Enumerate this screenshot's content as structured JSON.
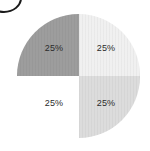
{
  "chart_data": {
    "type": "pie",
    "title": "",
    "subtitle": "",
    "xlabel": "",
    "ylabel": "",
    "legend_position": "none",
    "grid": false,
    "categories": [
      "Top left",
      "Top right",
      "Bottom right",
      "Bottom left"
    ],
    "values": [
      25,
      25,
      25,
      25
    ],
    "labels": [
      "25%",
      "25%",
      "25%",
      "25%"
    ],
    "slices": [
      {
        "name": "slice-top-left",
        "label": "25%",
        "value": 25,
        "start_angle": 270,
        "end_angle": 360,
        "color": "#9d9d9d",
        "filled": true
      },
      {
        "name": "slice-top-right",
        "label": "25%",
        "value": 25,
        "start_angle": 0,
        "end_angle": 90,
        "color": "#f0f0f0",
        "filled": true
      },
      {
        "name": "slice-bottom-right",
        "label": "25%",
        "value": 25,
        "start_angle": 90,
        "end_angle": 180,
        "color": "#dcdcdc",
        "filled": true
      },
      {
        "name": "slice-bottom-left",
        "label": "25%",
        "value": 25,
        "start_angle": 180,
        "end_angle": 270,
        "color": "#ffffff",
        "filled": false
      }
    ]
  },
  "annotations": {
    "corner_mark": {
      "name": "partial-circle-outline",
      "color": "#1b1b1b"
    }
  },
  "canvas": {
    "background": "#ffffff"
  }
}
